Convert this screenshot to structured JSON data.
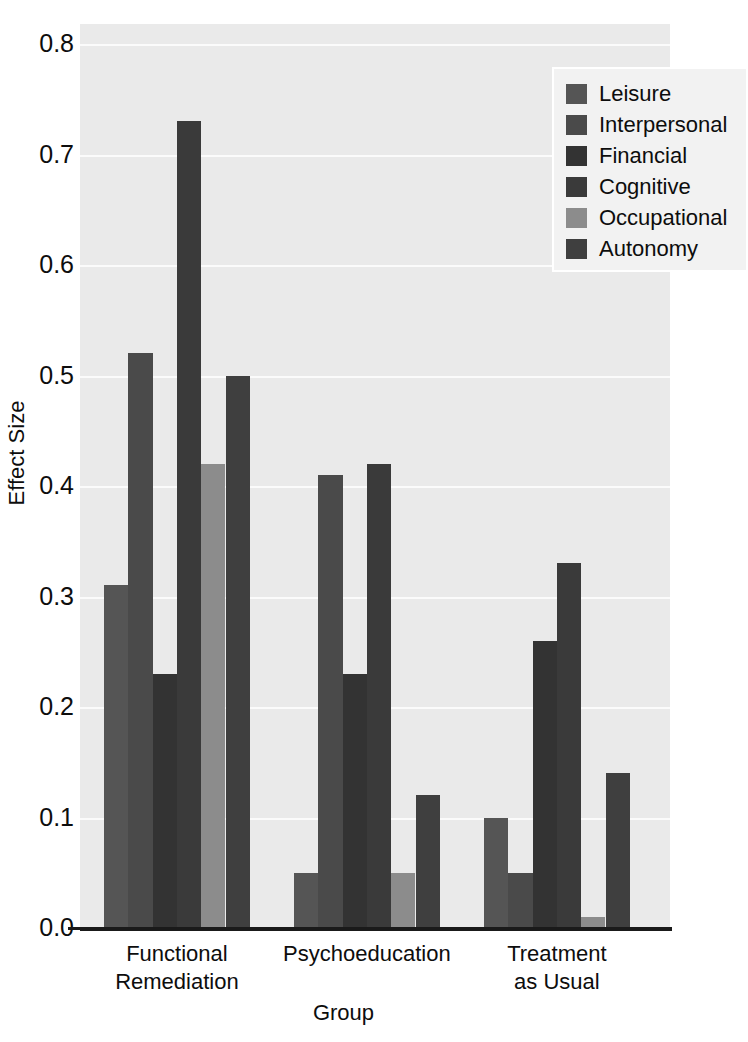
{
  "chart_data": {
    "type": "bar",
    "title": "",
    "subtitle": "",
    "xlabel": "Group",
    "ylabel": "Effect Size",
    "categories": [
      "Functional Remediation",
      "Psychoeducation",
      "Treatment as Usual"
    ],
    "category_lines": [
      [
        "Functional",
        "Remediation"
      ],
      [
        "Psychoeducation",
        ""
      ],
      [
        "Treatment",
        "as Usual"
      ]
    ],
    "series": [
      {
        "name": "Leisure",
        "color": "#555555",
        "values": [
          0.31,
          0.05,
          0.1
        ]
      },
      {
        "name": "Interpersonal",
        "color": "#4a4a4a",
        "values": [
          0.52,
          0.41,
          0.05
        ]
      },
      {
        "name": "Financial",
        "color": "#333333",
        "values": [
          0.23,
          0.23,
          0.26
        ]
      },
      {
        "name": "Cognitive",
        "color": "#3a3a3a",
        "values": [
          0.73,
          0.42,
          0.33
        ]
      },
      {
        "name": "Occupational",
        "color": "#8c8c8c",
        "values": [
          0.42,
          0.05,
          0.01
        ]
      },
      {
        "name": "Autonomy",
        "color": "#3f3f3f",
        "values": [
          0.5,
          0.12,
          0.14
        ]
      }
    ],
    "ylim": [
      0.0,
      0.8
    ],
    "ytick_labels": [
      "0.8",
      "0.7",
      "0.6",
      "0.5",
      "0.4",
      "0.3",
      "0.2",
      "0.1",
      "0.0"
    ],
    "ytick_values": [
      0.8,
      0.7,
      0.6,
      0.5,
      0.4,
      0.3,
      0.2,
      0.1,
      0.0
    ],
    "grid": true,
    "grid_color": "#fbfbfb",
    "plot_background": "#eaeaea",
    "legend_position": "top-right"
  },
  "legend": {
    "entries": [
      {
        "label": "Leisure"
      },
      {
        "label": "Interpersonal"
      },
      {
        "label": "Financial"
      },
      {
        "label": "Cognitive"
      },
      {
        "label": "Occupational"
      },
      {
        "label": "Autonomy"
      }
    ]
  },
  "axes": {
    "y_title": "Effect Size",
    "x_title": "Group"
  }
}
